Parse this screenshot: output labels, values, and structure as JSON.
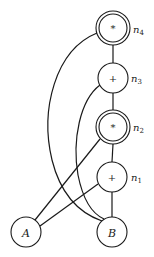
{
  "diagram": {
    "type": "dag",
    "nodes": [
      {
        "id": "n4",
        "op": "*",
        "label": "n",
        "sub": "4",
        "double": true
      },
      {
        "id": "n3",
        "op": "+",
        "label": "n",
        "sub": "3",
        "double": false
      },
      {
        "id": "n2",
        "op": "*",
        "label": "n",
        "sub": "2",
        "double": true
      },
      {
        "id": "n1",
        "op": "+",
        "label": "n",
        "sub": "1",
        "double": false
      },
      {
        "id": "A",
        "op": "A",
        "label": "",
        "sub": "",
        "double": false
      },
      {
        "id": "B",
        "op": "B",
        "label": "",
        "sub": "",
        "double": false
      }
    ],
    "edges": [
      {
        "from": "n4",
        "to": "n3"
      },
      {
        "from": "n4",
        "to": "B"
      },
      {
        "from": "n3",
        "to": "n2"
      },
      {
        "from": "n3",
        "to": "B"
      },
      {
        "from": "n2",
        "to": "n1"
      },
      {
        "from": "n2",
        "to": "A"
      },
      {
        "from": "n1",
        "to": "A"
      },
      {
        "from": "n1",
        "to": "B"
      }
    ]
  }
}
